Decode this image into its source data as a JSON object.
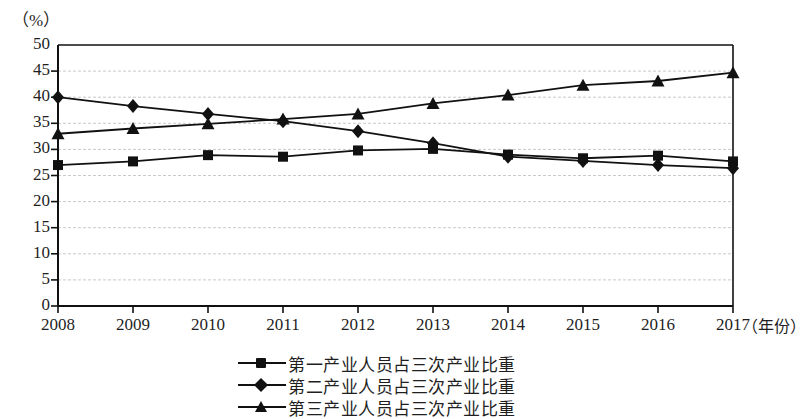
{
  "chart_data": {
    "type": "line",
    "title": "",
    "xlabel": "（年份）",
    "ylabel": "（%）",
    "x": [
      "2008",
      "2009",
      "2010",
      "2011",
      "2012",
      "2013",
      "2014",
      "2015",
      "2016",
      "2017"
    ],
    "categories": [
      "2008",
      "2009",
      "2010",
      "2011",
      "2012",
      "2013",
      "2014",
      "2015",
      "2016",
      "2017"
    ],
    "xlim": [
      2008,
      2017
    ],
    "ylim": [
      0,
      50
    ],
    "yticks": [
      "0",
      "5",
      "10",
      "15",
      "20",
      "25",
      "30",
      "35",
      "40",
      "45",
      "50"
    ],
    "ytick_values": [
      0,
      5,
      10,
      15,
      20,
      25,
      30,
      35,
      40,
      45,
      50
    ],
    "grid": true,
    "grid_style": "dashed-light-gray",
    "legend_position": "bottom-center",
    "series": [
      {
        "name": "第一产业人员占三次产业比重",
        "marker": "square",
        "color": "#111111",
        "values": [
          27.0,
          27.7,
          28.9,
          28.6,
          29.8,
          30.1,
          29.0,
          28.3,
          28.8,
          27.7
        ]
      },
      {
        "name": "第二产业人员占三次产业比重",
        "marker": "diamond",
        "color": "#111111",
        "values": [
          40.0,
          38.3,
          36.8,
          35.4,
          33.5,
          31.2,
          28.6,
          27.8,
          27.0,
          26.4
        ]
      },
      {
        "name": "第三产业人员占三次产业比重",
        "marker": "triangle",
        "color": "#111111",
        "values": [
          33.0,
          34.0,
          34.9,
          35.8,
          36.8,
          38.8,
          40.4,
          42.3,
          43.1,
          44.7
        ]
      }
    ]
  },
  "axes": {
    "y_unit": "（%）",
    "x_unit": "（年份）"
  },
  "legend": {
    "items": [
      {
        "label": "第一产业人员占三次产业比重",
        "marker": "square"
      },
      {
        "label": "第二产业人员占三次产业比重",
        "marker": "diamond"
      },
      {
        "label": "第三产业人员占三次产业比重",
        "marker": "triangle"
      }
    ]
  },
  "colors": {
    "ink": "#111111",
    "grid": "#c9c9c9",
    "background": "#ffffff"
  }
}
